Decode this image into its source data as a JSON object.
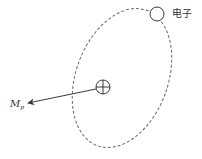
{
  "diagram": {
    "type": "orbital-magnetic-moment",
    "labels": {
      "electron": "电子",
      "moment_main": "M",
      "moment_sub": "p"
    },
    "colors": {
      "orbit": "#6a6a6a",
      "stroke": "#3a3a3a",
      "text": "#333333",
      "background": "#ffffff"
    },
    "elements": {
      "orbit": {
        "cx": 122,
        "cy": 78,
        "rx": 48,
        "ry": 72,
        "rotate": 20,
        "style": "dashed"
      },
      "nucleus": {
        "cx": 103,
        "cy": 87,
        "r": 7,
        "symbol": "plus-in-circle"
      },
      "electron": {
        "cx": 157,
        "cy": 14,
        "r": 7
      },
      "moment_arrow": {
        "x1": 96,
        "y1": 89,
        "x2": 28,
        "y2": 103
      }
    }
  }
}
